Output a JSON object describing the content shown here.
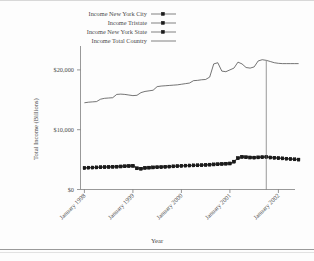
{
  "chart_data": {
    "type": "line",
    "title": "",
    "xlabel": "Year",
    "ylabel": "Total Income (Billions)",
    "ylim": [
      0,
      24000
    ],
    "yticks": [
      0,
      10000,
      20000
    ],
    "ytick_labels": [
      "$0",
      "$10,000",
      "$20,000"
    ],
    "xtick_labels": [
      "January 1998",
      "January 1999",
      "January 2000",
      "January 2001",
      "January 2002"
    ],
    "xlim_months": [
      0,
      53
    ],
    "grid": false,
    "legend_position": "top-center",
    "annotations": [
      {
        "name": "vertical-reference-line",
        "x_month": 45,
        "y_from": 0,
        "y_to": 21500
      }
    ],
    "series": [
      {
        "name": "Income New York City",
        "marker": "square",
        "values": [
          3550,
          3600,
          3620,
          3640,
          3680,
          3700,
          3720,
          3740,
          3760,
          3800,
          3840,
          3880,
          3900,
          3500,
          3420,
          3560,
          3600,
          3640,
          3680,
          3700,
          3740,
          3780,
          3820,
          3860,
          3900,
          3940,
          3960,
          3980,
          4000,
          4020,
          4060,
          4100,
          4140,
          4180,
          4220,
          4260,
          4300,
          4600,
          5200,
          5400,
          5350,
          5300,
          5280,
          5320,
          5360,
          5400,
          5300,
          5250,
          5200,
          5150,
          5100,
          5050,
          5000,
          4950
        ]
      },
      {
        "name": "Income Tristate",
        "marker": "square",
        "values": [
          3650,
          3700,
          3720,
          3740,
          3780,
          3800,
          3820,
          3840,
          3860,
          3900,
          3940,
          3980,
          4000,
          3600,
          3520,
          3660,
          3700,
          3740,
          3780,
          3800,
          3840,
          3880,
          3920,
          3960,
          4000,
          4040,
          4060,
          4080,
          4100,
          4120,
          4160,
          4200,
          4240,
          4280,
          4320,
          4360,
          4400,
          4700,
          5300,
          5500,
          5450,
          5400,
          5380,
          5420,
          5460,
          5500,
          5400,
          5350,
          5300,
          5250,
          5200,
          5150,
          5100,
          5050
        ]
      },
      {
        "name": "Income New York State",
        "marker": "square",
        "values": [
          3600,
          3650,
          3670,
          3690,
          3730,
          3750,
          3770,
          3790,
          3810,
          3850,
          3890,
          3930,
          3950,
          3550,
          3470,
          3610,
          3650,
          3690,
          3730,
          3750,
          3790,
          3830,
          3870,
          3910,
          3950,
          3990,
          4010,
          4030,
          4050,
          4070,
          4110,
          4150,
          4190,
          4230,
          4270,
          4310,
          4350,
          4650,
          5250,
          5450,
          5400,
          5350,
          5330,
          5370,
          5410,
          5450,
          5350,
          5300,
          5250,
          5200,
          5150,
          5100,
          5050,
          5000
        ]
      },
      {
        "name": "Income Total Country",
        "marker": "none",
        "values": [
          14500,
          14600,
          14650,
          14700,
          15100,
          15250,
          15300,
          15350,
          15900,
          15950,
          15900,
          15800,
          15700,
          15750,
          16200,
          16400,
          16500,
          16600,
          17200,
          17300,
          17350,
          17400,
          17450,
          17500,
          17600,
          17700,
          17800,
          18200,
          18250,
          18350,
          18400,
          18800,
          21000,
          21200,
          19800,
          19700,
          20000,
          20300,
          21300,
          21000,
          20400,
          20300,
          20500,
          21500,
          21700,
          21600,
          21400,
          21200,
          21100,
          21050,
          21050,
          21050,
          21050,
          21050
        ]
      }
    ]
  },
  "legend": {
    "items": [
      {
        "label": "Income New York City",
        "marker": "square-line"
      },
      {
        "label": "Income Tristate",
        "marker": "square-line"
      },
      {
        "label": "Income New York State",
        "marker": "square-line"
      },
      {
        "label": "Income Total Country",
        "marker": "plain-line"
      }
    ]
  }
}
